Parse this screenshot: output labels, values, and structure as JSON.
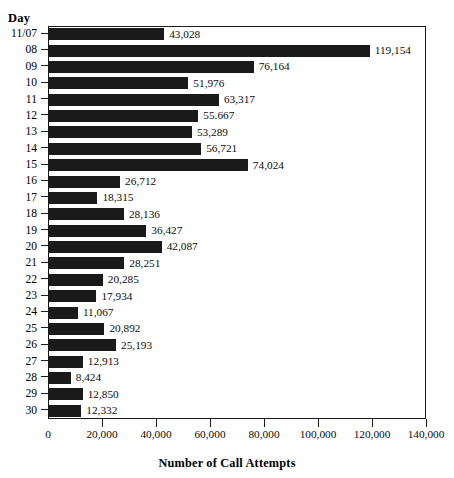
{
  "chart_data": {
    "type": "bar",
    "orientation": "horizontal",
    "title": "",
    "xlabel": "Number of Call Attempts",
    "ylabel": "Day",
    "xlim": [
      0,
      140000
    ],
    "ylim": null,
    "grid": false,
    "legend": null,
    "xticks": [
      "0",
      "20,000",
      "40,000",
      "60,000",
      "80,000",
      "100,000",
      "120,000",
      "140,000"
    ],
    "xtick_values": [
      0,
      20000,
      40000,
      60000,
      80000,
      100000,
      120000,
      140000
    ],
    "categories": [
      "11/07",
      "08",
      "09",
      "10",
      "11",
      "12",
      "13",
      "14",
      "15",
      "16",
      "17",
      "18",
      "19",
      "20",
      "21",
      "22",
      "23",
      "24",
      "25",
      "26",
      "27",
      "28",
      "29",
      "30"
    ],
    "values": [
      43028,
      119154,
      76164,
      51976,
      63317,
      55667,
      53289,
      56721,
      74024,
      26712,
      18315,
      28136,
      36427,
      42087,
      28251,
      20285,
      17934,
      11067,
      20892,
      25193,
      12913,
      8424,
      12850,
      12332
    ],
    "value_labels": [
      "43,028",
      "119,154",
      "76,164",
      "51,976",
      "63,317",
      "55.667",
      "53,289",
      "56,721",
      "74,024",
      "26,712",
      "18,315",
      "28,136",
      "36,427",
      "42,087",
      "28,251",
      "20,285",
      "17,934",
      "11,067",
      "20,892",
      "25,193",
      "12,913",
      "8,424",
      "12,850",
      "12,332"
    ],
    "bar_color": "#1a1a1a",
    "axis_color": "#1b1b1b",
    "background": "#ffffff"
  },
  "axes": {
    "y_header": "Day",
    "x_title": "Number of Call Attempts"
  }
}
